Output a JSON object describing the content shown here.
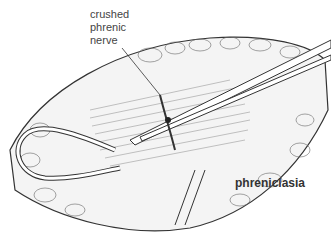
{
  "figure": {
    "labels": {
      "annotation_line1": "crushed",
      "annotation_line2": "phrenic",
      "annotation_line3": "nerve",
      "title": "phreniclasia"
    },
    "colors": {
      "line": "#333333",
      "fill": "#f2f2f2",
      "background": "#ffffff"
    }
  }
}
